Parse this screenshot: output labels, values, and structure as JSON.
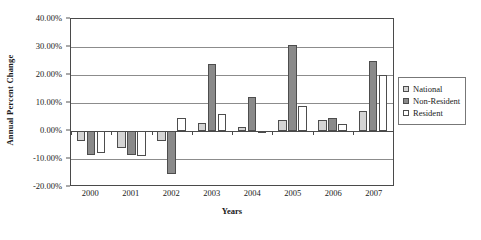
{
  "chart_data": {
    "type": "bar",
    "title": "",
    "xlabel": "Years",
    "ylabel": "Annual Percent Change",
    "categories": [
      "2000",
      "2001",
      "2002",
      "2003",
      "2004",
      "2005",
      "2006",
      "2007"
    ],
    "series": [
      {
        "name": "National",
        "color": "#d4d4d4",
        "values": [
          -3.5,
          -6.0,
          -3.5,
          3.0,
          1.5,
          4.0,
          4.0,
          7.0
        ]
      },
      {
        "name": "Non-Resident",
        "color": "#8a8a8a",
        "values": [
          -8.5,
          -8.5,
          -15.5,
          24.0,
          12.0,
          30.7,
          4.5,
          25.0
        ]
      },
      {
        "name": "Resident",
        "color": "#ffffff",
        "values": [
          -8.0,
          -8.8,
          4.5,
          6.0,
          -0.5,
          9.0,
          2.5,
          20.0
        ]
      }
    ],
    "ylim": [
      -20,
      40
    ],
    "ytick_values": [
      40,
      30,
      20,
      10,
      0,
      -10,
      -20
    ],
    "ytick_labels": [
      "40.00%",
      "30.00%",
      "20.00%",
      "10.00%",
      "0.00%",
      "-10.00%",
      "-20.00%"
    ],
    "grid": true,
    "legend_position": "right",
    "legend_entries": [
      "National",
      "Non-Resident",
      "Resident"
    ]
  }
}
